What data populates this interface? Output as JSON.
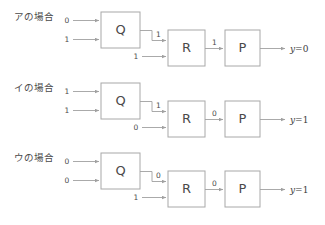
{
  "diagram": {
    "type": "logic-circuit-cases",
    "box_labels": {
      "first": "Q",
      "second": "R",
      "third": "P"
    },
    "rows": [
      {
        "case_label": "アの場合",
        "q_input_top": "0",
        "q_input_bottom": "1",
        "q_output": "1",
        "r_input_bottom": "1",
        "r_output": "1",
        "p_output": "y=0",
        "p_output_var": "y",
        "p_output_value": "=0"
      },
      {
        "case_label": "イの場合",
        "q_input_top": "1",
        "q_input_bottom": "1",
        "q_output": "1",
        "r_input_bottom": "0",
        "r_output": "0",
        "p_output": "y=1",
        "p_output_var": "y",
        "p_output_value": "=1"
      },
      {
        "case_label": "ウの場合",
        "q_input_top": "0",
        "q_input_bottom": "0",
        "q_output": "0",
        "r_input_bottom": "1",
        "r_output": "0",
        "p_output": "y=1",
        "p_output_var": "y",
        "p_output_value": "=1"
      }
    ],
    "colors": {
      "box_border": "#a8a8a8",
      "wire": "#a0a0a0",
      "text": "#4a4a4a",
      "background": "#ffffff"
    }
  }
}
